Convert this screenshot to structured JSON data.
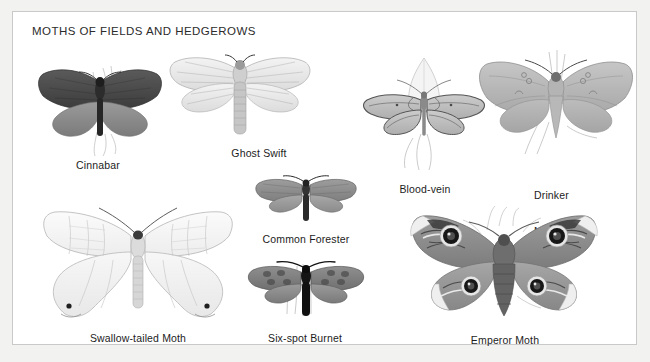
{
  "plate": {
    "title": "MOTHS OF FIELDS AND HEDGEROWS",
    "background_color": "#f2f2f0",
    "panel_color": "#ffffff",
    "border_color": "#c9c9c9",
    "text_color": "#1c1c1c"
  },
  "specimens": [
    {
      "id": "cinnabar",
      "label": "Cinnabar",
      "forewing_color": "#4a4a4a",
      "hindwing_color": "#8c8c8c",
      "body_color": "#2a2a2a"
    },
    {
      "id": "ghost-swift",
      "label": "Ghost Swift",
      "forewing_color": "#e8e8e8",
      "hindwing_color": "#ececec",
      "body_color": "#b9b9b9"
    },
    {
      "id": "blood-vein",
      "label": "Blood-vein",
      "forewing_color": "#bdbdbd",
      "hindwing_color": "#c4c4c4",
      "body_color": "#8f8f8f"
    },
    {
      "id": "drinker-moth",
      "label": "Drinker\nMoth",
      "label_line_1": "Drinker",
      "label_line_2": "Moth",
      "forewing_color": "#b8b8b8",
      "hindwing_color": "#bfbfbf",
      "body_color": "#a5a5a5"
    },
    {
      "id": "common-forester",
      "label": "Common Forester",
      "forewing_color": "#8b8b8b",
      "hindwing_color": "#9a9a9a",
      "body_color": "#3a3a3a"
    },
    {
      "id": "swallow-tailed-moth",
      "label": "Swallow-tailed Moth",
      "forewing_color": "#f1f1f1",
      "hindwing_color": "#f4f4f4",
      "body_color": "#cfcfcf"
    },
    {
      "id": "six-spot-burnet",
      "label": "Six-spot Burnet",
      "forewing_color": "#7d7d7d",
      "hindwing_color": "#8a8a8a",
      "body_color": "#141414"
    },
    {
      "id": "emperor-moth",
      "label": "Emperor Moth",
      "forewing_color": "#909090",
      "hindwing_color": "#9c9c9c",
      "body_color": "#5a5a5a",
      "eyespot_color": "#111111",
      "eyespot_count": 4
    }
  ]
}
